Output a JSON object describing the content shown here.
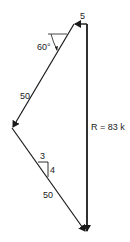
{
  "diagram": {
    "type": "force-polygon",
    "labels": {
      "top_force": "5",
      "angle": "60°",
      "upper_force": "50",
      "slope_run": "3",
      "slope_rise": "4",
      "lower_force": "50",
      "resultant": "R = 83 k"
    },
    "colors": {
      "line": "#1a1a1a",
      "background": "#ffffff"
    }
  }
}
